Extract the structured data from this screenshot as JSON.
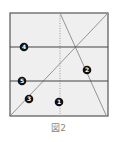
{
  "figure": {
    "caption": "図2",
    "box": {
      "x": 10,
      "y": 13,
      "width": 98,
      "height": 103,
      "fill": "#efefef",
      "stroke": "#555555"
    },
    "lines": [
      {
        "id": "horizontal-upper",
        "x1": 10,
        "y1": 47,
        "x2": 108,
        "y2": 47,
        "style": "solid",
        "color": "#444444"
      },
      {
        "id": "horizontal-lower",
        "x1": 10,
        "y1": 81,
        "x2": 108,
        "y2": 81,
        "style": "solid",
        "color": "#444444"
      },
      {
        "id": "vertical-center",
        "x1": 60,
        "y1": 13,
        "x2": 60,
        "y2": 116,
        "style": "dotted",
        "color": "#999999"
      },
      {
        "id": "diagonal-rising",
        "x1": 11,
        "y1": 115,
        "x2": 108,
        "y2": 13,
        "style": "solid",
        "color": "#888888"
      },
      {
        "id": "diagonal-steep",
        "x1": 60,
        "y1": 13,
        "x2": 106,
        "y2": 114,
        "style": "solid",
        "color": "#888888"
      }
    ],
    "markers": [
      {
        "label": "1",
        "x": 59,
        "y": 102
      },
      {
        "label": "2",
        "x": 87,
        "y": 70
      },
      {
        "label": "3",
        "x": 29,
        "y": 99
      },
      {
        "label": "4",
        "x": 24,
        "y": 47
      },
      {
        "label": "5",
        "x": 22,
        "y": 81
      }
    ]
  }
}
